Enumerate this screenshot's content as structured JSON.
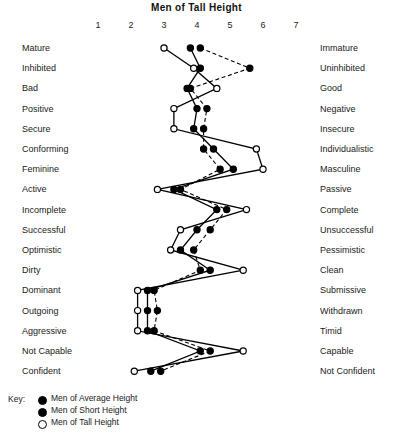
{
  "chart_data": {
    "type": "line",
    "title": "Men of Tall Height",
    "xlabel": "",
    "ylabel": "",
    "xlim": [
      1,
      7
    ],
    "grid": false,
    "legend_position": "bottom-left",
    "scale_ticks": [
      "1",
      "2",
      "3",
      "4",
      "5",
      "6",
      "7"
    ],
    "left_labels": [
      "Mature",
      "Inhibited",
      "Bad",
      "Positive",
      "Secure",
      "Conforming",
      "Feminine",
      "Active",
      "Incomplete",
      "Successful",
      "Optimistic",
      "Dirty",
      "Dominant",
      "Outgoing",
      "Aggressive",
      "Not Capable",
      "Confident"
    ],
    "right_labels": [
      "Immature",
      "Uninhibited",
      "Good",
      "Negative",
      "Insecure",
      "Individualistic",
      "Masculine",
      "Passive",
      "Complete",
      "Unsuccessful",
      "Pessimistic",
      "Clean",
      "Submissive",
      "Withdrawn",
      "Timid",
      "Capable",
      "Not Confident"
    ],
    "categories": [
      "Mature–Immature",
      "Inhibited–Uninhibited",
      "Bad–Good",
      "Positive–Negative",
      "Secure–Insecure",
      "Conforming–Individualistic",
      "Feminine–Masculine",
      "Active–Passive",
      "Incomplete–Complete",
      "Successful–Unsuccessful",
      "Optimistic–Pessimistic",
      "Dirty–Clean",
      "Dominant–Submissive",
      "Outgoing–Withdrawn",
      "Aggressive–Timid",
      "Not Capable–Capable",
      "Confident–Not Confident"
    ],
    "series": [
      {
        "name": "Men of Average Height",
        "marker": "filled-circle",
        "line": "solid",
        "values": [
          3.8,
          4.1,
          3.7,
          4.0,
          3.9,
          4.5,
          5.1,
          3.3,
          4.6,
          4.0,
          3.5,
          4.4,
          2.5,
          2.5,
          2.5,
          4.1,
          2.6
        ]
      },
      {
        "name": "Men of Short Height",
        "marker": "filled-circle",
        "line": "dashed",
        "values": [
          4.1,
          5.6,
          3.8,
          4.3,
          4.2,
          4.2,
          4.7,
          3.5,
          4.9,
          4.4,
          3.9,
          4.1,
          2.7,
          2.8,
          2.7,
          4.4,
          2.9
        ]
      },
      {
        "name": "Men of Tall Height",
        "marker": "open-circle",
        "line": "solid",
        "values": [
          3.0,
          3.9,
          4.6,
          3.3,
          3.3,
          5.8,
          6.0,
          2.8,
          5.5,
          3.5,
          3.2,
          5.4,
          2.2,
          2.2,
          2.2,
          5.4,
          2.1
        ]
      }
    ]
  },
  "legend": {
    "title": "Key:",
    "entries": [
      {
        "label": "Men of Average Height",
        "marker": "filled-circle"
      },
      {
        "label": "Men of Short Height",
        "marker": "filled-circle-short"
      },
      {
        "label": "Men of Tall Height",
        "marker": "open-circle"
      }
    ]
  },
  "colors": {
    "ink": "#000000",
    "background": "#ffffff",
    "text": "#1a1a1a"
  }
}
